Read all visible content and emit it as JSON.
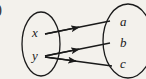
{
  "figure": {
    "kind": "mapping-diagram",
    "caption_fragment": ")",
    "background_color": "#f3f1ec",
    "ink_color": "#1a1a1a",
    "width": 146,
    "height": 79
  },
  "domain_set": {
    "name": "left-set",
    "elements": [
      {
        "id": "x",
        "label": "x",
        "x": 36,
        "y": 32
      },
      {
        "id": "y",
        "label": "y",
        "x": 36,
        "y": 55
      }
    ],
    "ellipse": {
      "cx": 41,
      "cy": 44,
      "rx": 19,
      "ry": 32
    }
  },
  "codomain_set": {
    "name": "right-set",
    "elements": [
      {
        "id": "a",
        "label": "a",
        "x": 124,
        "y": 22
      },
      {
        "id": "b",
        "label": "b",
        "x": 124,
        "y": 43
      },
      {
        "id": "c",
        "label": "c",
        "x": 124,
        "y": 64
      }
    ],
    "ellipse": {
      "cx": 128,
      "cy": 41,
      "rx": 25,
      "ry": 37
    }
  },
  "arrows": [
    {
      "id": "x-to-a",
      "from": "x",
      "to": "a",
      "x1": 45,
      "y1": 34,
      "x2": 110,
      "y2": 21
    },
    {
      "id": "y-to-b",
      "from": "y",
      "to": "b",
      "x1": 45,
      "y1": 56,
      "x2": 110,
      "y2": 43
    },
    {
      "id": "y-to-c",
      "from": "y",
      "to": "c",
      "x1": 45,
      "y1": 57,
      "x2": 112,
      "y2": 66
    }
  ]
}
